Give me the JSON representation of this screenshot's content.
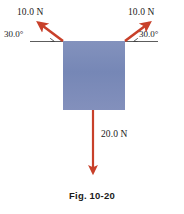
{
  "figure": {
    "caption": "Fig. 10-20",
    "background_color": "#ffffff"
  },
  "block": {
    "name": "block",
    "fill_color": "#7889b8",
    "x": 63,
    "y": 41,
    "width": 62,
    "height": 69
  },
  "forces": [
    {
      "id": "force-left",
      "magnitude_label": "10.0 N",
      "angle_label": "30.0°",
      "color": "#c8402a",
      "direction": "up-left",
      "tail_x": 63,
      "tail_y": 41,
      "tip_x": 36,
      "tip_y": 21
    },
    {
      "id": "force-right",
      "magnitude_label": "10.0 N",
      "angle_label": "30.0°",
      "color": "#c8402a",
      "direction": "up-right",
      "tail_x": 125,
      "tail_y": 41,
      "tip_x": 152,
      "tip_y": 21
    },
    {
      "id": "force-weight",
      "magnitude_label": "20.0 N",
      "angle_label": "",
      "color": "#c8402a",
      "direction": "down",
      "tail_x": 93,
      "tail_y": 110,
      "tip_x": 93,
      "tip_y": 178
    }
  ],
  "colors": {
    "arrow": "#c8402a",
    "block": "#7889b8",
    "text": "#1a1a1a",
    "reference_line": "#3a3a3a"
  }
}
